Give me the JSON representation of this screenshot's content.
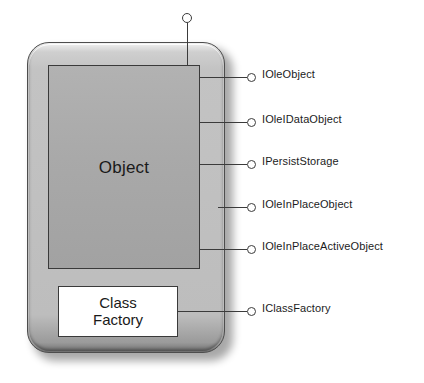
{
  "diagram": {
    "container": {
      "name": "com-server-module"
    },
    "object_box": {
      "label": "Object"
    },
    "factory_box": {
      "label_line1": "Class",
      "label_line2": "Factory"
    },
    "top_interface": {
      "label": "IUnknown",
      "icon": "lollipop-circle-icon"
    },
    "interfaces": [
      {
        "label": "IOleObject",
        "icon": "lollipop-circle-icon",
        "source": "object-box",
        "y": 78,
        "stem_left": 200
      },
      {
        "label": "IOleIDataObject",
        "icon": "lollipop-circle-icon",
        "source": "object-box",
        "y": 123,
        "stem_left": 200
      },
      {
        "label": "IPersistStorage",
        "icon": "lollipop-circle-icon",
        "source": "object-box",
        "y": 165,
        "stem_left": 200
      },
      {
        "label": "IOleInPlaceObject",
        "icon": "lollipop-circle-icon",
        "source": "container",
        "y": 208,
        "stem_left": 218
      },
      {
        "label": "IOleInPlaceActiveObject",
        "icon": "lollipop-circle-icon",
        "source": "object-box",
        "y": 250,
        "stem_left": 200
      },
      {
        "label": "IClassFactory",
        "icon": "lollipop-circle-icon",
        "source": "factory-box",
        "y": 312,
        "stem_left": 178
      }
    ],
    "colors": {
      "shell_fill": "#c0c0c0",
      "object_fill": "#a9a9a9",
      "factory_fill": "#ffffff",
      "line": "#3b3b3b",
      "text": "#1c1c1c",
      "background": "#ffffff"
    }
  }
}
